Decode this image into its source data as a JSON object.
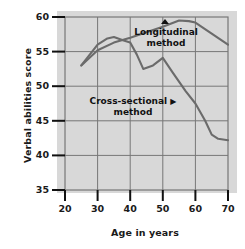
{
  "chart_data": {
    "type": "line",
    "title": "",
    "xlabel": "Age in years",
    "ylabel": "Verbal abilities score",
    "xlim": [
      20,
      70
    ],
    "ylim": [
      35,
      60
    ],
    "xticks": [
      20,
      30,
      40,
      50,
      60,
      70
    ],
    "yticks": [
      35,
      40,
      45,
      50,
      55,
      60
    ],
    "grid": true,
    "legend_position": "inline-annotations",
    "background": "#d8d8d8",
    "line_color": "#6b6b6b",
    "text_color": "#1a1a1a",
    "series": [
      {
        "name": "Longitudinal method",
        "marker": "▲",
        "label_line1": "Longitudinal",
        "label_line2": "method",
        "x": [
          25,
          30,
          35,
          40,
          45,
          50,
          55,
          58,
          60,
          65,
          70
        ],
        "values": [
          53.0,
          55.2,
          56.3,
          57.0,
          57.8,
          58.6,
          59.5,
          59.4,
          59.2,
          57.6,
          56.0
        ]
      },
      {
        "name": "Cross-sectional method",
        "marker": "▶",
        "label_line1": "Cross-sectional",
        "label_line2": "method",
        "x": [
          25,
          30,
          33,
          35,
          38,
          40,
          42,
          44,
          47,
          50,
          53,
          57,
          60,
          63,
          65,
          67,
          70
        ],
        "values": [
          53.0,
          56.0,
          56.9,
          57.1,
          56.6,
          56.3,
          54.6,
          52.5,
          53.0,
          54.1,
          52.0,
          49.3,
          47.5,
          45.0,
          43.0,
          42.4,
          42.2
        ]
      }
    ]
  },
  "axes": {
    "ylabel": "Verbal abilities score",
    "xlabel": "Age in years",
    "ytick_labels": [
      "60",
      "55",
      "50",
      "45",
      "40",
      "35"
    ],
    "xtick_labels": [
      "20",
      "30",
      "40",
      "50",
      "60",
      "70"
    ]
  },
  "annotations": {
    "longitudinal": {
      "line1": "Longitudinal",
      "line2": "method",
      "marker": "▲"
    },
    "cross_sectional": {
      "line1": "Cross-sectional",
      "marker": "▶",
      "line2": "method"
    }
  }
}
